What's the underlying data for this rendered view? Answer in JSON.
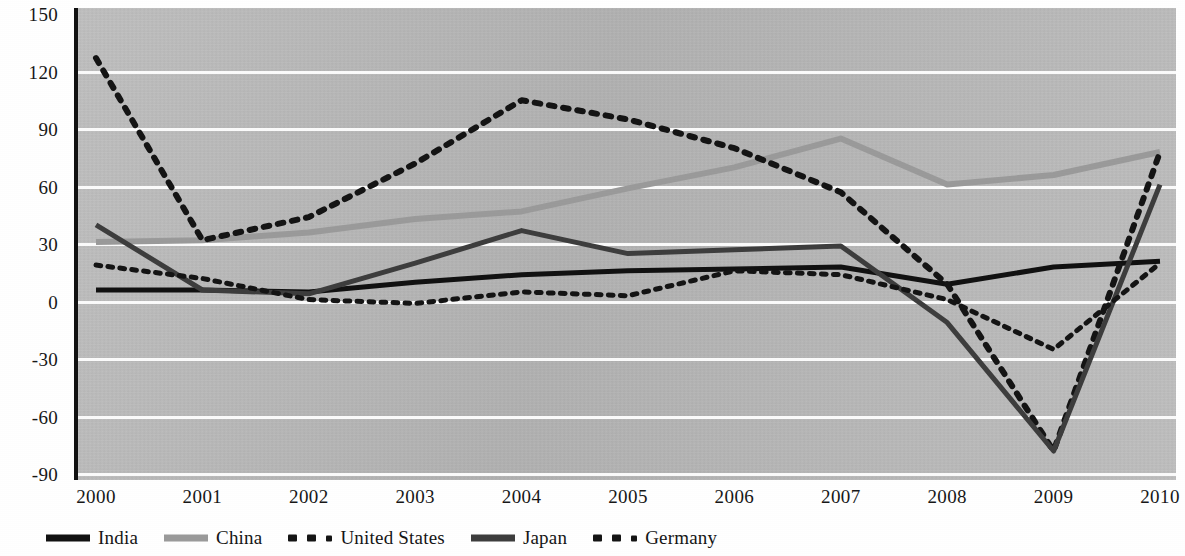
{
  "chart_data": {
    "type": "line",
    "title": "",
    "subtitle": "",
    "xlabel": "",
    "ylabel": "",
    "x": [
      2000,
      2001,
      2002,
      2003,
      2004,
      2005,
      2006,
      2007,
      2008,
      2009,
      2010
    ],
    "categories": [
      "2000",
      "2001",
      "2002",
      "2003",
      "2004",
      "2005",
      "2006",
      "2007",
      "2008",
      "2009",
      "2010"
    ],
    "ylim": [
      -90,
      150
    ],
    "yticks": [
      -90,
      -60,
      -30,
      0,
      30,
      60,
      90,
      120,
      150
    ],
    "ytick_labels": [
      "-90",
      "-60",
      "-30",
      "0",
      "30",
      "60",
      "90",
      "120",
      "150"
    ],
    "grid": true,
    "legend_position": "bottom-left",
    "series": [
      {
        "name": "India",
        "style": "solid",
        "color": "#111111",
        "width": 5,
        "values": [
          6,
          6,
          5,
          10,
          14,
          16,
          17,
          18,
          9,
          18,
          21
        ]
      },
      {
        "name": "China",
        "style": "solid",
        "color": "#9a9a9a",
        "width": 6,
        "values": [
          31,
          32,
          36,
          43,
          47,
          59,
          70,
          85,
          61,
          66,
          78
        ]
      },
      {
        "name": "United States",
        "style": "dotted",
        "color": "#141414",
        "width": 6,
        "values": [
          127,
          32,
          44,
          72,
          105,
          95,
          80,
          57,
          9,
          -78,
          78
        ]
      },
      {
        "name": "Japan",
        "style": "solid",
        "color": "#3d3d3d",
        "width": 5,
        "values": [
          40,
          6,
          4,
          20,
          37,
          25,
          27,
          29,
          -11,
          -78,
          61
        ]
      },
      {
        "name": "Germany",
        "style": "dotted",
        "color": "#141414",
        "width": 5,
        "values": [
          19,
          12,
          1,
          -1,
          5,
          3,
          16,
          14,
          1,
          -25,
          20
        ]
      }
    ]
  },
  "legend": {
    "items": [
      {
        "label": "India",
        "icon": "solid-line-swatch"
      },
      {
        "label": "China",
        "icon": "solid-line-swatch"
      },
      {
        "label": "United States",
        "icon": "dotted-line-swatch"
      },
      {
        "label": "Japan",
        "icon": "solid-line-swatch"
      },
      {
        "label": "Germany",
        "icon": "dotted-line-swatch"
      }
    ]
  },
  "colors": {
    "plot_background": "#bdbdbd",
    "gridline": "#fbfbfb",
    "axis": "#111111",
    "india": "#111111",
    "china": "#9a9a9a",
    "united_states": "#141414",
    "japan": "#3d3d3d",
    "germany": "#141414"
  }
}
